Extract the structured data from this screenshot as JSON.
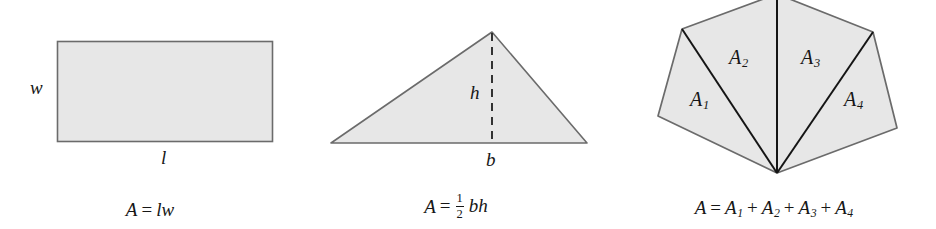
{
  "figure": {
    "background_color": "#ffffff",
    "shape_fill_color": "#e7e7e7",
    "shape_stroke_color": "#6b6b6b",
    "divider_stroke_color": "#1a1a1a",
    "label_color": "#161616"
  },
  "panels": [
    {
      "id": "rectangle",
      "shape_name": "rectangle",
      "labels": [
        {
          "name": "width-label",
          "text": "w"
        },
        {
          "name": "length-label",
          "text": "l"
        }
      ],
      "formula": {
        "area_symbol": "A",
        "equals": "=",
        "expression": "lw",
        "plain_text": "A = lw"
      },
      "geometry": {
        "x": 57,
        "y": 41,
        "width": 215,
        "height": 100
      }
    },
    {
      "id": "triangle",
      "shape_name": "triangle",
      "labels": [
        {
          "name": "height-label",
          "text": "h"
        },
        {
          "name": "base-label",
          "text": "b"
        }
      ],
      "formula": {
        "area_symbol": "A",
        "equals": "=",
        "fraction_numerator": "1",
        "fraction_denominator": "2",
        "expression": "bh",
        "plain_text": "A = 1/2 bh"
      },
      "geometry": {
        "apex": [
          192,
          32
        ],
        "left": [
          31,
          143
        ],
        "right": [
          287,
          143
        ],
        "dashed_height_line": [
          [
            192,
            32
          ],
          [
            192,
            143
          ]
        ]
      }
    },
    {
      "id": "polygon",
      "shape_name": "hexagon-partitioned",
      "labels": [
        {
          "name": "region-label-a1",
          "text": "A",
          "subscript": "1"
        },
        {
          "name": "region-label-a2",
          "text": "A",
          "subscript": "2"
        },
        {
          "name": "region-label-a3",
          "text": "A",
          "subscript": "3"
        },
        {
          "name": "region-label-a4",
          "text": "A",
          "subscript": "4"
        }
      ],
      "formula": {
        "area_symbol": "A",
        "equals": "=",
        "terms": [
          {
            "symbol": "A",
            "subscript": "1"
          },
          {
            "symbol": "A",
            "subscript": "2"
          },
          {
            "symbol": "A",
            "subscript": "3"
          },
          {
            "symbol": "A",
            "subscript": "4"
          }
        ],
        "operator": "+",
        "plain_text": "A = A1 + A2 + A3 + A4"
      },
      "geometry": {
        "vertices": [
          [
            165,
            -4
          ],
          [
            261,
            32
          ],
          [
            285,
            128
          ],
          [
            165,
            173
          ],
          [
            46,
            116
          ],
          [
            70,
            29
          ]
        ],
        "fan_center": [
          165,
          173
        ],
        "divider_endpoints": [
          [
            70,
            29
          ],
          [
            165,
            -4
          ],
          [
            261,
            32
          ]
        ]
      }
    }
  ]
}
